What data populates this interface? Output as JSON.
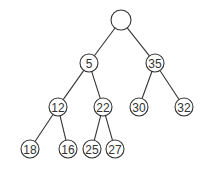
{
  "diagram": {
    "type": "binary-tree",
    "nodes": [
      {
        "id": "root",
        "label": "",
        "x": 121,
        "y": 20,
        "r": 10
      },
      {
        "id": "n5",
        "label": "5",
        "x": 89,
        "y": 63,
        "r": 9
      },
      {
        "id": "n35",
        "label": "35",
        "x": 155,
        "y": 63,
        "r": 9
      },
      {
        "id": "n12",
        "label": "12",
        "x": 58,
        "y": 107,
        "r": 9
      },
      {
        "id": "n22",
        "label": "22",
        "x": 103,
        "y": 107,
        "r": 9
      },
      {
        "id": "n30",
        "label": "30",
        "x": 139,
        "y": 107,
        "r": 9
      },
      {
        "id": "n32",
        "label": "32",
        "x": 184,
        "y": 107,
        "r": 9
      },
      {
        "id": "n18",
        "label": "18",
        "x": 30,
        "y": 149,
        "r": 9
      },
      {
        "id": "n16",
        "label": "16",
        "x": 68,
        "y": 149,
        "r": 9
      },
      {
        "id": "n25",
        "label": "25",
        "x": 92,
        "y": 149,
        "r": 9
      },
      {
        "id": "n27",
        "label": "27",
        "x": 115,
        "y": 149,
        "r": 9
      }
    ],
    "edges": [
      [
        "root",
        "n5"
      ],
      [
        "root",
        "n35"
      ],
      [
        "n5",
        "n12"
      ],
      [
        "n5",
        "n22"
      ],
      [
        "n35",
        "n30"
      ],
      [
        "n35",
        "n32"
      ],
      [
        "n12",
        "n18"
      ],
      [
        "n12",
        "n16"
      ],
      [
        "n22",
        "n25"
      ],
      [
        "n22",
        "n27"
      ]
    ]
  }
}
